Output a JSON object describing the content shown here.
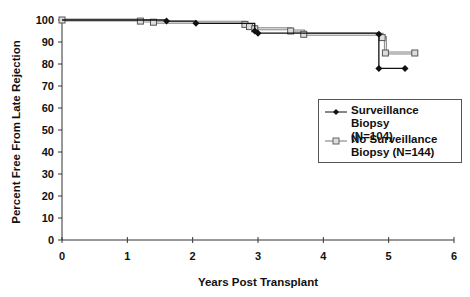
{
  "chart_data": {
    "type": "line",
    "subtype": "kaplan-meier step",
    "title": "",
    "xlabel": "Years Post Transplant",
    "ylabel": "Percent Free From Late Rejection",
    "xlim": [
      0,
      6
    ],
    "ylim": [
      0,
      100
    ],
    "xticks": [
      0,
      1,
      2,
      3,
      4,
      5,
      6
    ],
    "yticks": [
      0,
      10,
      20,
      30,
      40,
      50,
      60,
      70,
      80,
      90,
      100
    ],
    "grid": false,
    "legend_position": "right-middle",
    "series": [
      {
        "name": "Surveillance Biopsy (N=104)",
        "marker": "filled-diamond",
        "color": "#111111",
        "points": [
          [
            0,
            100
          ],
          [
            1.6,
            99.5
          ],
          [
            2.05,
            98.5
          ],
          [
            2.95,
            95
          ],
          [
            3.0,
            94
          ],
          [
            4.85,
            93.5
          ],
          [
            4.85,
            78
          ],
          [
            5.25,
            78
          ]
        ]
      },
      {
        "name": "No Surveillance Biopsy (N=144)",
        "marker": "open-square",
        "color": "#777777",
        "points": [
          [
            0,
            100
          ],
          [
            1.2,
            99.5
          ],
          [
            1.4,
            99
          ],
          [
            2.8,
            98
          ],
          [
            2.87,
            97
          ],
          [
            2.95,
            96
          ],
          [
            3.5,
            95
          ],
          [
            3.7,
            93.5
          ],
          [
            4.9,
            92
          ],
          [
            4.95,
            85
          ],
          [
            5.4,
            85
          ]
        ]
      }
    ]
  },
  "legend": {
    "items": [
      {
        "line1": "Surveillance Biopsy",
        "line2": "(N=104)"
      },
      {
        "line1": "No Surveillance",
        "line2": "Biopsy (N=144)"
      }
    ]
  }
}
